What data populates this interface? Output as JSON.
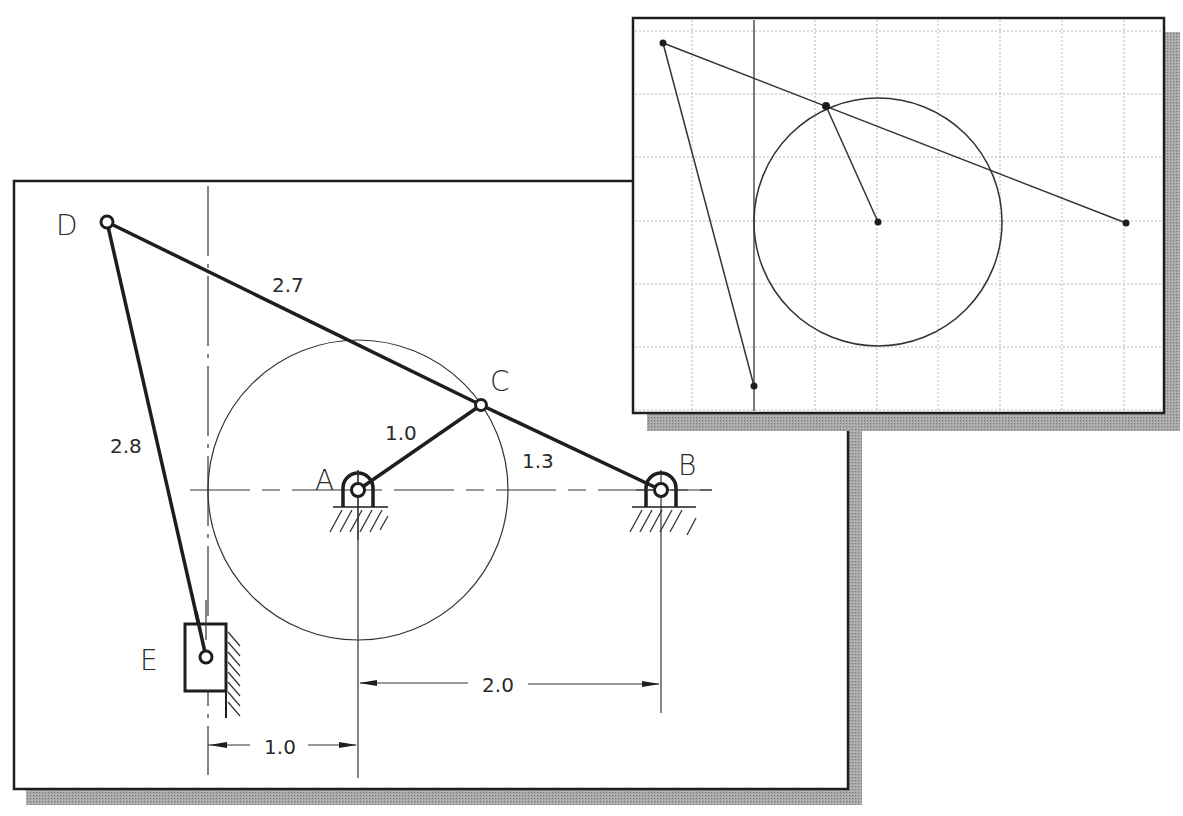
{
  "colors": {
    "ink": "#1e1e1e",
    "thin_ink": "#333333",
    "grid": "#b8b8b8",
    "shadow": "#9a9a9a",
    "paper": "#ffffff"
  },
  "main_view": {
    "labels": {
      "A": "A",
      "B": "B",
      "C": "C",
      "D": "D",
      "E": "E"
    },
    "link_lengths": {
      "AC": "1.0",
      "CB": "1.3",
      "DC": "2.7",
      "DE": "2.8"
    },
    "dimensions": {
      "A_to_B": "2.0",
      "E_to_A": "1.0"
    }
  },
  "inset_view": {
    "grid_columns": 9,
    "grid_rows": 7
  }
}
